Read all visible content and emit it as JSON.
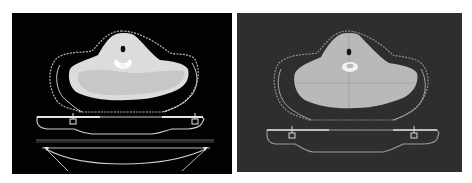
{
  "figure": {
    "panels": [
      {
        "id": "left",
        "description": "Axial CT slice of neck/shoulder region on black background with immobilization mask outline, treatment couch and curved base support",
        "background": "#020202",
        "body_color": "#dcdcdc",
        "outline_color": "#bfbfbf"
      },
      {
        "id": "right",
        "description": "Axial CT slice of same region on dark gray background with immobilization mask outline and couch; crosshair lines through body",
        "background": "#2e2e2e",
        "body_color": "#b9b9b9",
        "outline_color": "#9a9a9a"
      }
    ]
  }
}
